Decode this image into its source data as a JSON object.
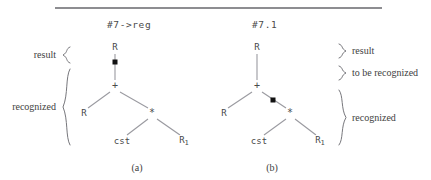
{
  "figure": {
    "width": 431,
    "height": 180,
    "rule_color": "#8d8d91",
    "edge_color": "#9a9aa0",
    "dot_color": "#111111"
  },
  "trees": [
    {
      "id": "a",
      "title": "#7->reg",
      "caption": "(a)",
      "nodes": [
        {
          "name": "root",
          "label": "R",
          "x": 115,
          "y": 47
        },
        {
          "name": "plus",
          "label": "+",
          "x": 115,
          "y": 86
        },
        {
          "name": "left-child",
          "label": "R",
          "x": 84,
          "y": 113
        },
        {
          "name": "times",
          "label": "*",
          "x": 152,
          "y": 113
        },
        {
          "name": "cst",
          "label": "cst",
          "x": 122,
          "y": 141
        },
        {
          "name": "r-sub-one",
          "label": "R",
          "sub": "1",
          "x": 184,
          "y": 141
        }
      ],
      "edges": [
        {
          "name": "root-to-plus",
          "x1": 115,
          "y1": 54,
          "x2": 115,
          "y2": 80
        },
        {
          "name": "plus-to-left",
          "x1": 110,
          "y1": 92,
          "x2": 88,
          "y2": 108
        },
        {
          "name": "plus-to-times",
          "x1": 120,
          "y1": 92,
          "x2": 148,
          "y2": 108
        },
        {
          "name": "times-to-cst",
          "x1": 148,
          "y1": 119,
          "x2": 127,
          "y2": 135
        },
        {
          "name": "times-to-r1",
          "x1": 157,
          "y1": 119,
          "x2": 180,
          "y2": 135
        }
      ],
      "dot": {
        "name": "parse-position-dot",
        "x": 115,
        "y": 62
      }
    },
    {
      "id": "b",
      "title": "#7.1",
      "caption": "(b)",
      "nodes": [
        {
          "name": "root",
          "label": "R",
          "x": 257,
          "y": 47
        },
        {
          "name": "plus",
          "label": "+",
          "x": 257,
          "y": 86
        },
        {
          "name": "left-child",
          "label": "R",
          "x": 224,
          "y": 113
        },
        {
          "name": "times",
          "label": "*",
          "x": 290,
          "y": 113
        },
        {
          "name": "cst",
          "label": "cst",
          "x": 259,
          "y": 141
        },
        {
          "name": "r-sub-one",
          "label": "R",
          "sub": "1",
          "x": 320,
          "y": 141
        }
      ],
      "edges": [
        {
          "name": "root-to-plus",
          "x1": 257,
          "y1": 54,
          "x2": 257,
          "y2": 80
        },
        {
          "name": "plus-to-left",
          "x1": 252,
          "y1": 92,
          "x2": 228,
          "y2": 108
        },
        {
          "name": "plus-to-times",
          "x1": 262,
          "y1": 92,
          "x2": 286,
          "y2": 108
        },
        {
          "name": "times-to-cst",
          "x1": 286,
          "y1": 119,
          "x2": 264,
          "y2": 135
        },
        {
          "name": "times-to-r1",
          "x1": 295,
          "y1": 119,
          "x2": 316,
          "y2": 135
        }
      ],
      "dot": {
        "name": "parse-position-dot",
        "x": 273,
        "y": 100
      }
    }
  ],
  "left_labels": [
    {
      "name": "result",
      "text": "result",
      "x": 56,
      "y": 55,
      "brace_top": 46,
      "brace_height": 18
    },
    {
      "name": "recognized",
      "text": "recognized",
      "x": 56,
      "y": 107,
      "brace_top": 68,
      "brace_height": 78
    }
  ],
  "right_labels": [
    {
      "name": "result",
      "text": "result",
      "x": 352,
      "y": 51,
      "brace_top": 43,
      "brace_height": 16
    },
    {
      "name": "to-be-recognized",
      "text": "to be recognized",
      "x": 352,
      "y": 73,
      "brace_top": 65,
      "brace_height": 16
    },
    {
      "name": "recognized",
      "text": "recognized",
      "x": 352,
      "y": 118,
      "brace_top": 89,
      "brace_height": 57
    }
  ],
  "captions": [
    {
      "name": "caption-a",
      "text": "(a)",
      "x": 137,
      "y": 162
    },
    {
      "name": "caption-b",
      "text": "(b)",
      "x": 272,
      "y": 162
    }
  ]
}
